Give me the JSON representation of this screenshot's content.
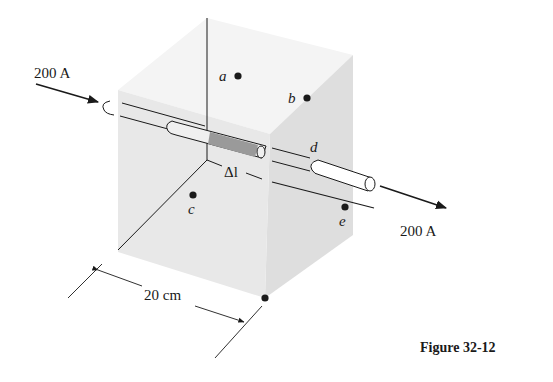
{
  "figure": {
    "caption": "Figure 32-12",
    "current_in_label": "200 A",
    "current_out_label": "200 A",
    "segment_label": "Δl",
    "dimension_label": "20 cm",
    "points": [
      {
        "id": "a",
        "label": "a"
      },
      {
        "id": "b",
        "label": "b"
      },
      {
        "id": "c",
        "label": "c"
      },
      {
        "id": "d",
        "label": "d"
      },
      {
        "id": "e",
        "label": "e"
      }
    ],
    "colors": {
      "cube_front": "#e6e6e6",
      "cube_top": "#f4f4f4",
      "cube_right": "#dcdcdc",
      "segment_fill": "#9a9a9a",
      "ink": "#1a1a1a"
    }
  }
}
